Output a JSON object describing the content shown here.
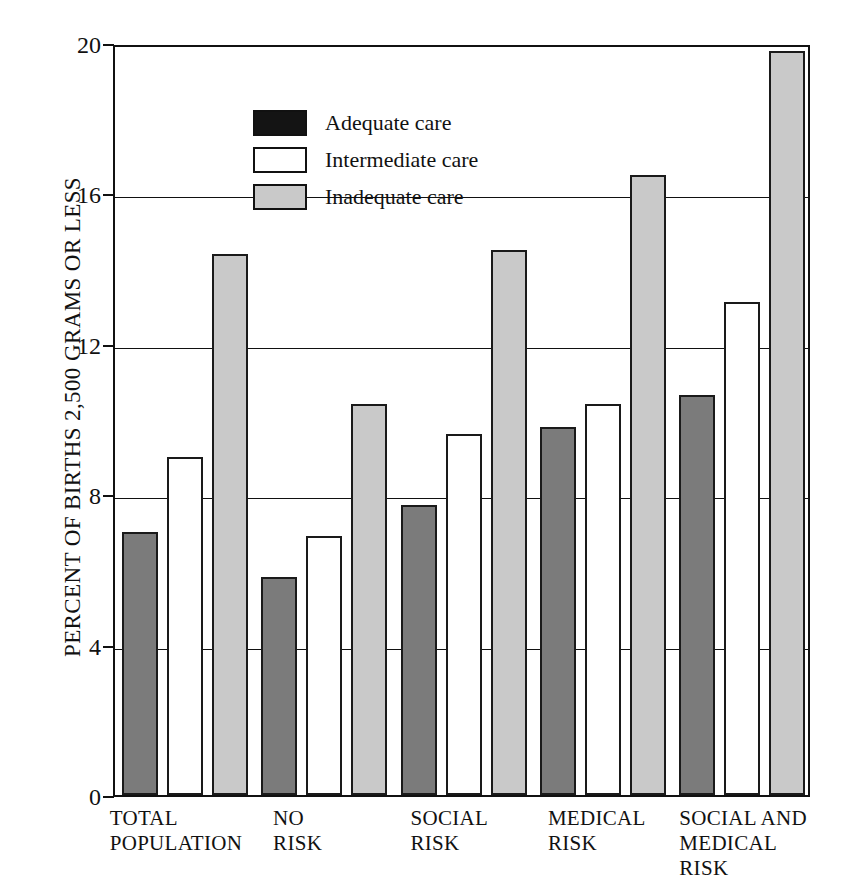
{
  "chart_data": {
    "type": "bar",
    "title": "",
    "xlabel": "",
    "ylabel": "PERCENT OF BIRTHS 2,500 GRAMS OR LESS",
    "ylim": [
      0,
      20
    ],
    "yticks": [
      0,
      4,
      8,
      12,
      16,
      20
    ],
    "grid": true,
    "legend_position": "top-left inside plot",
    "categories": [
      "TOTAL\nPOPULATION",
      "NO\nRISK",
      "SOCIAL\nRISK",
      "MEDICAL\nRISK",
      "SOCIAL AND\nMEDICAL\nRISK"
    ],
    "series": [
      {
        "name": "Adequate care",
        "color": "#141414",
        "values": [
          7.0,
          5.8,
          7.7,
          9.8,
          10.65
        ]
      },
      {
        "name": "Intermediate care",
        "color": "#ffffff",
        "values": [
          9.0,
          6.9,
          9.6,
          10.4,
          13.1
        ]
      },
      {
        "name": "Inadequate care",
        "color": "#c9c9c9",
        "values": [
          14.4,
          10.4,
          14.5,
          16.5,
          19.8
        ]
      }
    ]
  },
  "axis": {
    "y_title": "PERCENT OF BIRTHS 2,500 GRAMS OR LESS",
    "tick_labels": [
      "0",
      "4",
      "8",
      "12",
      "16",
      "20"
    ]
  },
  "legend": {
    "items": [
      {
        "label": "Adequate care"
      },
      {
        "label": "Intermediate care"
      },
      {
        "label": "Inadequate care"
      }
    ]
  },
  "x_labels": [
    "TOTAL\nPOPULATION",
    "NO\nRISK",
    "SOCIAL\nRISK",
    "MEDICAL\nRISK",
    "SOCIAL AND\nMEDICAL\nRISK"
  ]
}
